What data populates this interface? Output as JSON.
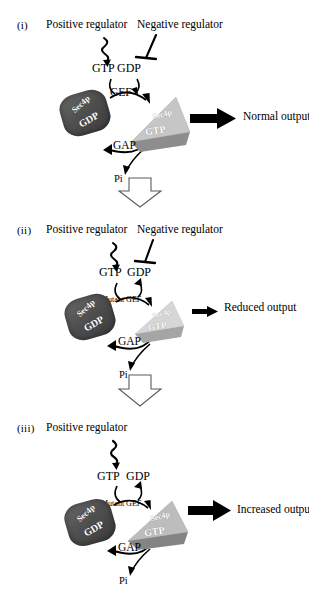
{
  "figure": {
    "nucleotide_gtp": "GTP",
    "nucleotide_gdp": "GDP",
    "protein_label": "Sec4p",
    "bound_gdp": "GDP",
    "bound_gtp": "GTP",
    "gap_label": "GAP",
    "pi_label": "Pi",
    "colors": {
      "gdp_blob": "#575757",
      "gdp_blob_dark": "#3f3f3f",
      "gtp_tri_light": "#c9c9c9",
      "gtp_tri_band": "#8f8f8f",
      "gtp_tri_light_faded": "#d8d8d8",
      "gtp_tri_band_faded": "#a8a8a8",
      "gtp_tri_light_strong": "#bdbdbd",
      "gtp_tri_band_strong": "#858585",
      "arrow_black": "#000000",
      "hollow_arrow_stroke": "#4a4a4a"
    }
  },
  "panels": [
    {
      "roman": "(i)",
      "positive_regulator": "Positive regulator",
      "negative_regulator": "Negative regulator",
      "gef_label": "GEF",
      "output_label": "Normal output",
      "output_strength": "normal"
    },
    {
      "roman": "(ii)",
      "positive_regulator": "Positive regulator",
      "negative_regulator": "Negative regulator",
      "gef_label": "Mutant GEF",
      "output_label": "Reduced output",
      "output_strength": "reduced"
    },
    {
      "roman": "(iii)",
      "positive_regulator": "Positive regulator",
      "negative_regulator": "",
      "gef_label": "Mutant GEF",
      "output_label": "Increased output",
      "output_strength": "increased"
    }
  ],
  "transitions": [
    {
      "name": "transition-1-to-2"
    },
    {
      "name": "transition-2-to-3"
    }
  ]
}
